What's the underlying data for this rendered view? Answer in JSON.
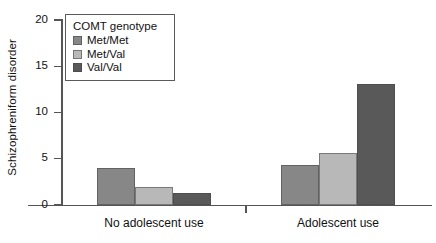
{
  "chart_data": {
    "type": "bar",
    "title": "",
    "xlabel": "",
    "ylabel": "Schizophreniform disorder",
    "categories": [
      "No adolescent use",
      "Adolescent use"
    ],
    "series": [
      {
        "name": "Met/Met",
        "color": "#878787",
        "values": [
          4.0,
          4.3
        ]
      },
      {
        "name": "Met/Val",
        "color": "#b8b8b8",
        "values": [
          1.9,
          5.6
        ]
      },
      {
        "name": "Val/Val",
        "color": "#595959",
        "values": [
          1.3,
          13.1
        ]
      }
    ],
    "ylim": [
      0,
      20
    ],
    "yticks": [
      0,
      5,
      10,
      15,
      20
    ],
    "ytick_labels": [
      "0",
      "5",
      "10",
      "15",
      "20"
    ],
    "grid": false,
    "legend": {
      "title": "COMT genotype",
      "position": "upper-left-inside",
      "entries": [
        "Met/Met",
        "Met/Val",
        "Val/Val"
      ]
    }
  }
}
